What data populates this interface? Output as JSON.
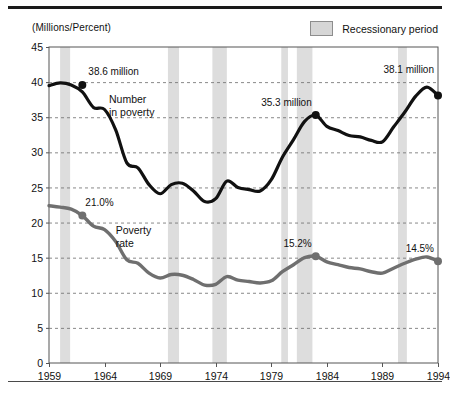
{
  "figure": {
    "axis_unit_label": "(Millions/Percent)",
    "legend": {
      "swatch_name": "recession-swatch",
      "label": "Recessionary period",
      "color": "#d6d6d6"
    }
  },
  "chart_data": {
    "type": "line",
    "title": "",
    "subtitle": "",
    "xlabel": "",
    "ylabel": "(Millions/Percent)",
    "xlim": [
      1959,
      1994
    ],
    "ylim": [
      0,
      45
    ],
    "yticks": [
      0,
      5,
      10,
      15,
      20,
      25,
      30,
      35,
      40,
      45
    ],
    "xticks": [
      1959,
      1964,
      1969,
      1974,
      1979,
      1984,
      1989,
      1994
    ],
    "grid": "horizontal-dashed",
    "legend_position": "top-right",
    "x": [
      1959,
      1960,
      1961,
      1962,
      1963,
      1964,
      1965,
      1966,
      1967,
      1968,
      1969,
      1970,
      1971,
      1972,
      1973,
      1974,
      1975,
      1976,
      1977,
      1978,
      1979,
      1980,
      1981,
      1982,
      1983,
      1984,
      1985,
      1986,
      1987,
      1988,
      1989,
      1990,
      1991,
      1992,
      1993,
      1994
    ],
    "series": [
      {
        "name": "Number in poverty",
        "label": "Number\nin poverty",
        "unit": "million",
        "color": "#111111",
        "values": [
          39.5,
          39.9,
          39.6,
          38.6,
          36.4,
          36.1,
          33.2,
          28.5,
          27.8,
          25.4,
          24.1,
          25.4,
          25.6,
          24.5,
          23.0,
          23.4,
          25.9,
          25.0,
          24.7,
          24.5,
          26.1,
          29.3,
          31.8,
          34.4,
          35.3,
          33.7,
          33.1,
          32.4,
          32.2,
          31.7,
          31.5,
          33.6,
          35.7,
          38.0,
          39.3,
          38.1
        ]
      },
      {
        "name": "Poverty rate",
        "label": "Poverty\nrate",
        "unit": "%",
        "color": "#6f6f6f",
        "values": [
          22.4,
          22.2,
          21.9,
          21.0,
          19.5,
          19.0,
          17.3,
          14.7,
          14.2,
          12.8,
          12.1,
          12.6,
          12.5,
          11.9,
          11.1,
          11.2,
          12.3,
          11.8,
          11.6,
          11.4,
          11.7,
          13.0,
          14.0,
          15.0,
          15.2,
          14.4,
          14.0,
          13.6,
          13.4,
          13.0,
          12.8,
          13.5,
          14.2,
          14.8,
          15.1,
          14.5
        ]
      }
    ],
    "annotations": [
      {
        "name": "number-1962-label",
        "text": "38.6 million",
        "x": 1962,
        "y": 39.6,
        "marker": true,
        "series": "Number in poverty"
      },
      {
        "name": "number-1983-label",
        "text": "35.3 million",
        "x": 1983,
        "y": 35.3,
        "marker": true,
        "series": "Number in poverty"
      },
      {
        "name": "number-1994-label",
        "text": "38.1 million",
        "x": 1994,
        "y": 38.1,
        "marker": true,
        "series": "Number in poverty"
      },
      {
        "name": "rate-1962-label",
        "text": "21.0%",
        "x": 1962,
        "y": 21.0,
        "marker": true,
        "series": "Poverty rate"
      },
      {
        "name": "rate-1983-label",
        "text": "15.2%",
        "x": 1983,
        "y": 15.2,
        "marker": true,
        "series": "Poverty rate"
      },
      {
        "name": "rate-1994-label",
        "text": "14.5%",
        "x": 1994,
        "y": 14.5,
        "marker": true,
        "series": "Poverty rate"
      }
    ],
    "recession_bands": [
      {
        "start": 1960.0,
        "end": 1960.9
      },
      {
        "start": 1969.7,
        "end": 1970.7
      },
      {
        "start": 1973.7,
        "end": 1975.0
      },
      {
        "start": 1979.9,
        "end": 1980.5
      },
      {
        "start": 1981.3,
        "end": 1982.7
      },
      {
        "start": 1990.4,
        "end": 1991.2
      }
    ],
    "band_color": "#dddddd"
  }
}
